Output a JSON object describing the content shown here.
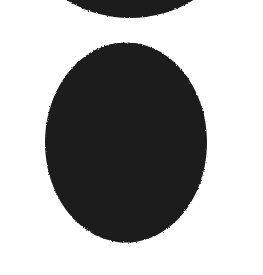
{
  "image": {
    "kind": "scanned-letterform",
    "glyph": "O",
    "script": "Latin",
    "case": "uppercase",
    "style": "serif",
    "width": 263,
    "height": 275,
    "background_color": "#ffffff",
    "ink_color": "#1a1a1a",
    "texture": "mottled scan grain along stroke edges"
  },
  "geometry": {
    "outer_ellipse": {
      "center_x": 130,
      "center_y": 141,
      "radius_x": 122,
      "radius_y": 123,
      "left": 8,
      "right": 252,
      "top": 18,
      "bottom": 264
    },
    "inner_counter": {
      "center_x": 126,
      "center_y": 142.5,
      "radius_x": 81,
      "radius_y": 100,
      "left": 45,
      "right": 207,
      "top": 43,
      "bottom": 242
    },
    "stroke": {
      "thick_side_px": 48,
      "thin_cap_px": 25,
      "stress_axis": "vertical",
      "contrast": "high"
    }
  }
}
